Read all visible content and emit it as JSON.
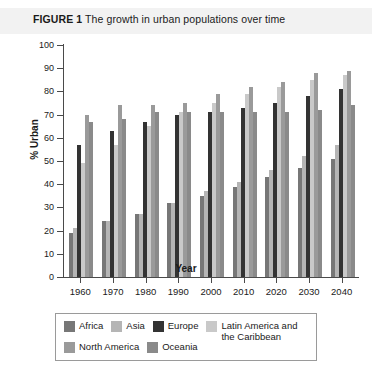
{
  "figure": {
    "number": "FIGURE 1",
    "title": "The growth in urban populations over time"
  },
  "chart_data": {
    "type": "bar",
    "title": "The growth in urban populations over time",
    "xlabel": "Year",
    "ylabel": "% Urban",
    "ylim": [
      0,
      100
    ],
    "ytick_step": 10,
    "yticks": [
      "0",
      "10",
      "20",
      "30",
      "40",
      "50",
      "60",
      "70",
      "80",
      "90",
      "100"
    ],
    "grid": false,
    "legend_position": "bottom",
    "categories": [
      "1960",
      "1970",
      "1980",
      "1990",
      "2000",
      "2010",
      "2020",
      "2030",
      "2040"
    ],
    "series": [
      {
        "name": "Africa",
        "color": "#777777",
        "values": [
          19,
          24,
          27,
          32,
          35,
          39,
          43,
          47,
          51
        ]
      },
      {
        "name": "Asia",
        "color": "#b5b5b5",
        "values": [
          21,
          24,
          27,
          32,
          37,
          41,
          46,
          52,
          57
        ]
      },
      {
        "name": "Europe",
        "color": "#333333",
        "values": [
          57,
          63,
          67,
          70,
          71,
          73,
          75,
          78,
          81
        ]
      },
      {
        "name": "Latin America and\nthe Caribbean",
        "color": "#c9c9c9",
        "values": [
          49,
          57,
          65,
          71,
          75,
          79,
          82,
          85,
          87
        ]
      },
      {
        "name": "North America",
        "color": "#9a9a9a",
        "values": [
          70,
          74,
          74,
          75,
          79,
          82,
          84,
          88,
          89
        ]
      },
      {
        "name": "Oceania",
        "color": "#8a8a8a",
        "values": [
          67,
          68,
          71,
          71,
          71,
          71,
          71,
          72,
          74
        ]
      }
    ]
  },
  "legend": {
    "row1": [
      {
        "label": "Africa",
        "color": "#777777"
      },
      {
        "label": "Asia",
        "color": "#b5b5b5"
      },
      {
        "label": "Europe",
        "color": "#333333"
      },
      {
        "label": "Latin America and\nthe Caribbean",
        "color": "#c9c9c9"
      }
    ],
    "row2": [
      {
        "label": "North America",
        "color": "#9a9a9a"
      },
      {
        "label": "Oceania",
        "color": "#8a8a8a"
      }
    ]
  }
}
